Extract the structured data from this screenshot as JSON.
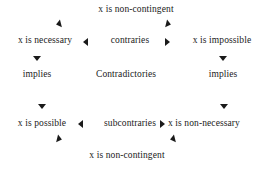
{
  "diagram": {
    "background_color": "#ffffff",
    "text_color": "#1a1a1a",
    "nodes": {
      "top_contingency": "x is non-contingent",
      "necessary": "x is necessary",
      "impossible": "x is impossible",
      "contraries": "contraries",
      "implies_left": "implies",
      "contradictories": "Contradictories",
      "implies_right": "implies",
      "possible": "x is possible",
      "subcontraries": "subcontraries",
      "non_necessary": "x is non-necessary",
      "bottom_contingency": "x is non-contingent"
    },
    "arrows": [
      {
        "name": "top-left-arrow",
        "direction": "left"
      },
      {
        "name": "top-right-arrow",
        "direction": "right"
      },
      {
        "name": "contraries-left-arrow",
        "direction": "left"
      },
      {
        "name": "contraries-right-arrow",
        "direction": "right"
      },
      {
        "name": "implies-left-down-arrow",
        "direction": "down"
      },
      {
        "name": "implies-right-down-arrow",
        "direction": "down"
      },
      {
        "name": "possible-down-arrow",
        "direction": "down"
      },
      {
        "name": "non-necessary-down-arrow",
        "direction": "down"
      },
      {
        "name": "subcontraries-left-arrow",
        "direction": "left"
      },
      {
        "name": "subcontraries-right-arrow",
        "direction": "right"
      },
      {
        "name": "bottom-left-arrow",
        "direction": "right"
      },
      {
        "name": "bottom-right-arrow",
        "direction": "left"
      }
    ]
  }
}
